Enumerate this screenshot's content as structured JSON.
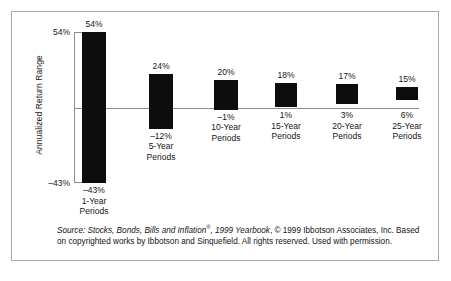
{
  "figure": {
    "axis_title": "Annualized Return Range",
    "axis_ticks": {
      "top": "54%",
      "bottom": "–43%"
    }
  },
  "source_note": {
    "line1_italic_lead": "Source: Stocks, Bonds, Bills and Inflation",
    "registered_mark": "®",
    "line1_italic_rest": ", 1999 Yearbook",
    "line1_rest": ", © 1999 Ibbotson Associates,",
    "line2": "Inc. Based on copyrighted works by Ibbotson and Sinquefield. All rights reserved.",
    "line3": "Used with permission."
  },
  "chart_data": {
    "type": "bar",
    "title": "",
    "subtitle": "",
    "xlabel": "",
    "ylabel": "Annualized Return Range",
    "ylim": [
      -43,
      54
    ],
    "grid": false,
    "legend": "none",
    "zero_line": true,
    "axis_tick_values": [
      54,
      -43
    ],
    "categories": [
      "1-Year Periods",
      "5-Year Periods",
      "10-Year Periods",
      "15-Year Periods",
      "20-Year Periods",
      "25-Year Periods"
    ],
    "series": [
      {
        "name": "Maximum Annualized Return",
        "values": [
          54,
          24,
          20,
          18,
          17,
          15
        ]
      },
      {
        "name": "Minimum Annualized Return",
        "values": [
          -43,
          -12,
          -1,
          1,
          3,
          6
        ]
      }
    ],
    "bars": [
      {
        "category_line1": "1-Year",
        "category_line2": "Periods",
        "high_label": "54%",
        "low_label": "–43%",
        "high": 54,
        "low": -43
      },
      {
        "category_line1": "5-Year",
        "category_line2": "Periods",
        "high_label": "24%",
        "low_label": "–12%",
        "high": 24,
        "low": -12
      },
      {
        "category_line1": "10-Year",
        "category_line2": "Periods",
        "high_label": "20%",
        "low_label": "–1%",
        "high": 20,
        "low": -1
      },
      {
        "category_line1": "15-Year",
        "category_line2": "Periods",
        "high_label": "18%",
        "low_label": "1%",
        "high": 18,
        "low": 1
      },
      {
        "category_line1": "20-Year",
        "category_line2": "Periods",
        "high_label": "17%",
        "low_label": "3%",
        "high": 17,
        "low": 3
      },
      {
        "category_line1": "25-Year",
        "category_line2": "Periods",
        "high_label": "15%",
        "low_label": "6%",
        "high": 15,
        "low": 6
      }
    ],
    "colors": {
      "bar": "#0d0d0d",
      "axis": "#8d8d8d",
      "text": "#141414",
      "frame": "#a8a8a8",
      "background": "#ffffff"
    }
  }
}
